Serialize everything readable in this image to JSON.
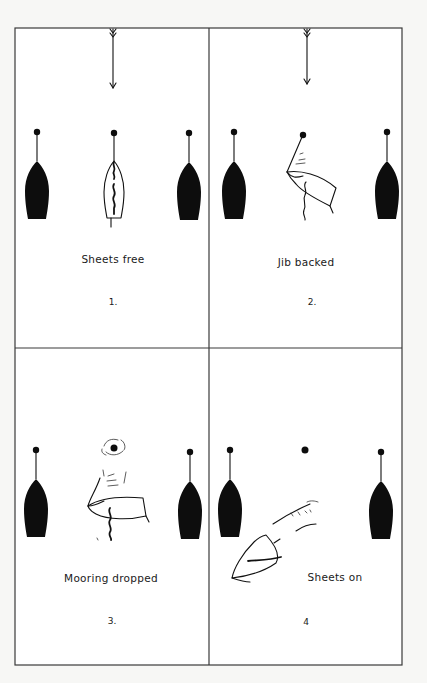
{
  "figure": {
    "panels": [
      {
        "id": 1,
        "caption": "Sheets free",
        "number": "1.",
        "wind_arrow": true
      },
      {
        "id": 2,
        "caption": "Jib backed",
        "number": "2.",
        "wind_arrow": true
      },
      {
        "id": 3,
        "caption": "Mooring dropped",
        "number": "3.",
        "wind_arrow": false
      },
      {
        "id": 4,
        "caption": "Sheets on",
        "number": "4",
        "wind_arrow": false
      }
    ],
    "colors": {
      "ink": "#111111",
      "frame": "#3a3a3a",
      "paper": "#ffffff"
    }
  }
}
